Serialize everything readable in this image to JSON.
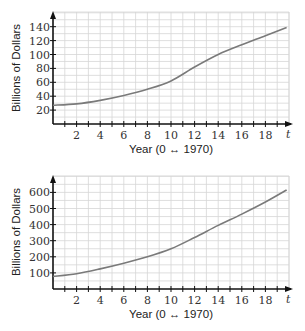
{
  "chart_data": [
    {
      "type": "line",
      "title": "",
      "xlabel": "Year (0 ↔ 1970)",
      "ylabel": "Billions of Dollars",
      "x_axis_var": "t",
      "xlim": [
        0,
        20
      ],
      "ylim": [
        0,
        150
      ],
      "xticks": [
        2,
        4,
        6,
        8,
        10,
        12,
        14,
        16,
        18
      ],
      "yticks": [
        20,
        40,
        60,
        80,
        100,
        120,
        140
      ],
      "grid": true,
      "x": [
        0,
        2,
        4,
        6,
        8,
        10,
        12,
        14,
        16,
        18,
        19.8
      ],
      "series": [
        {
          "name": "spending",
          "values": [
            27,
            29,
            34,
            41,
            50,
            62,
            82,
            100,
            114,
            127,
            139
          ]
        }
      ]
    },
    {
      "type": "line",
      "title": "",
      "xlabel": "Year (0 ↔ 1970)",
      "ylabel": "Billions of Dollars",
      "x_axis_var": "t",
      "xlim": [
        0,
        20
      ],
      "ylim": [
        0,
        680
      ],
      "xticks": [
        2,
        4,
        6,
        8,
        10,
        12,
        14,
        16,
        18
      ],
      "yticks": [
        100,
        200,
        300,
        400,
        500,
        600
      ],
      "grid": true,
      "x": [
        0,
        2,
        4,
        6,
        8,
        10,
        12,
        14,
        16,
        18,
        19.8
      ],
      "series": [
        {
          "name": "spending",
          "values": [
            78,
            95,
            125,
            160,
            200,
            250,
            320,
            395,
            465,
            540,
            615
          ]
        }
      ]
    }
  ],
  "layout": [
    {
      "x0": 53,
      "y0": 124,
      "px_per_x": 11.8,
      "px_per_y": 0.695,
      "grid_top": 12,
      "grid_right": 289,
      "ylabel_x": 20,
      "ylabel_y": 68,
      "xlabel_y": 153
    },
    {
      "x0": 53,
      "y0": 289,
      "px_per_x": 11.8,
      "px_per_y": 0.161,
      "grid_top": 176,
      "grid_right": 289,
      "ylabel_x": 20,
      "ylabel_y": 232,
      "xlabel_y": 318
    }
  ]
}
